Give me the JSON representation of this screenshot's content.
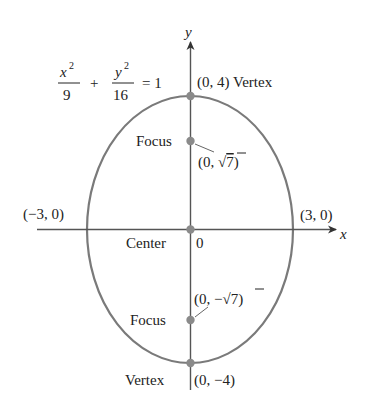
{
  "equation": {
    "term1_num": "x",
    "term1_exp": "2",
    "term1_den": "9",
    "plus": "+",
    "term2_num": "y",
    "term2_exp": "2",
    "term2_den": "16",
    "equals": "= 1"
  },
  "axes": {
    "x_label": "x",
    "y_label": "y",
    "origin_label": "0"
  },
  "points": {
    "top_vertex": {
      "coord": "(0, 4)",
      "label": "Vertex"
    },
    "bottom_vertex": {
      "coord": "(0, −4)",
      "label": "Vertex"
    },
    "upper_focus": {
      "label": "Focus",
      "coord_open": "(0, ",
      "sqrt": "√",
      "radicand": "7",
      "coord_close": ")"
    },
    "lower_focus": {
      "label": "Focus",
      "coord_open": "(0, −",
      "sqrt": "√",
      "radicand": "7",
      "coord_close": ")"
    },
    "center": {
      "label": "Center"
    },
    "left_intercept": {
      "coord": "(−3, 0)"
    },
    "right_intercept": {
      "coord": "(3, 0)"
    }
  },
  "colors": {
    "curve": "#7a7a7a",
    "axis": "#555555",
    "point": "#8a8a8a",
    "text": "#222222"
  }
}
